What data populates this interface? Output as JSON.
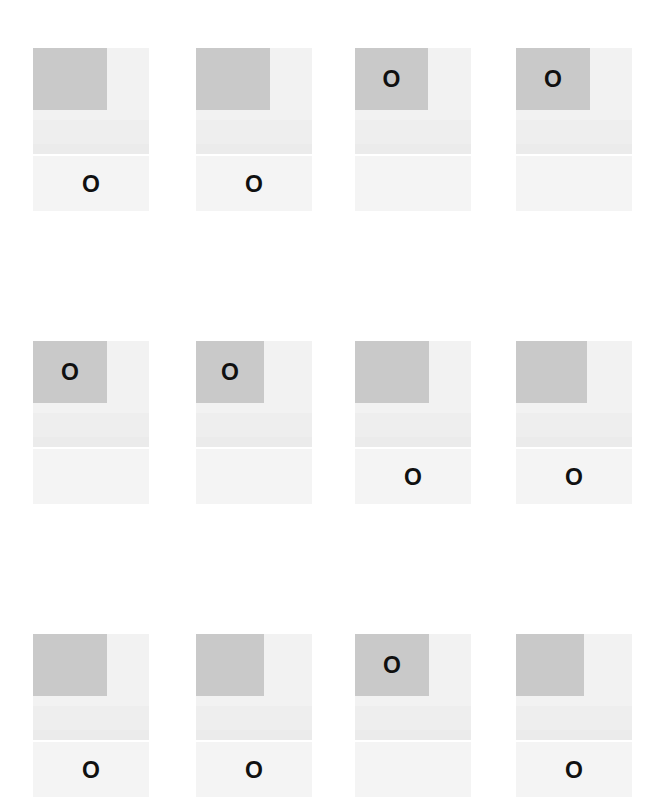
{
  "page": {
    "background_color": "#ffffff",
    "width": 665,
    "height": 797,
    "rows": 3,
    "columns": 4,
    "total_tiles": 12
  },
  "palette": {
    "block_gray": "#c9c9c9",
    "upper_base": "#f2f2f2",
    "mid_band": "#eeeeee",
    "stripe": "#ebebeb",
    "lower_band": "#f4f4f4",
    "marker_color": "#101010",
    "page_background": "#ffffff"
  },
  "marker": {
    "glyph": "O",
    "name": "letter-o-marker"
  },
  "tiles": [
    {
      "id": "tile-r1c1",
      "row": 1,
      "column": 1,
      "x": 33,
      "y": 48,
      "block": {
        "x": 0,
        "y": 0,
        "width": 74,
        "height": 62
      },
      "marker_location": "lower-band",
      "marker": "O"
    },
    {
      "id": "tile-r1c2",
      "row": 1,
      "column": 2,
      "x": 196,
      "y": 48,
      "block": {
        "x": 0,
        "y": 0,
        "width": 74,
        "height": 62
      },
      "marker_location": "lower-band",
      "marker": "O"
    },
    {
      "id": "tile-r1c3",
      "row": 1,
      "column": 3,
      "x": 355,
      "y": 48,
      "block": {
        "x": 0,
        "y": 0,
        "width": 73,
        "height": 62
      },
      "marker_location": "gray-block",
      "marker": "O"
    },
    {
      "id": "tile-r1c4",
      "row": 1,
      "column": 4,
      "x": 516,
      "y": 48,
      "block": {
        "x": 0,
        "y": 0,
        "width": 74,
        "height": 62
      },
      "marker_location": "gray-block",
      "marker": "O"
    },
    {
      "id": "tile-r2c1",
      "row": 2,
      "column": 1,
      "x": 33,
      "y": 341,
      "block": {
        "x": 0,
        "y": 0,
        "width": 74,
        "height": 62
      },
      "marker_location": "gray-block",
      "marker": "O"
    },
    {
      "id": "tile-r2c2",
      "row": 2,
      "column": 2,
      "x": 196,
      "y": 341,
      "block": {
        "x": 0,
        "y": 0,
        "width": 68,
        "height": 62
      },
      "marker_location": "gray-block",
      "marker": "O"
    },
    {
      "id": "tile-r2c3",
      "row": 2,
      "column": 3,
      "x": 355,
      "y": 341,
      "block": {
        "x": 0,
        "y": 0,
        "width": 74,
        "height": 62
      },
      "marker_location": "lower-band",
      "marker": "O"
    },
    {
      "id": "tile-r2c4",
      "row": 2,
      "column": 4,
      "x": 516,
      "y": 341,
      "block": {
        "x": 0,
        "y": 0,
        "width": 71,
        "height": 62
      },
      "marker_location": "lower-band",
      "marker": "O"
    },
    {
      "id": "tile-r3c1",
      "row": 3,
      "column": 1,
      "x": 33,
      "y": 634,
      "block": {
        "x": 0,
        "y": 0,
        "width": 74,
        "height": 62
      },
      "marker_location": "lower-band",
      "marker": "O"
    },
    {
      "id": "tile-r3c2",
      "row": 3,
      "column": 2,
      "x": 196,
      "y": 634,
      "block": {
        "x": 0,
        "y": 0,
        "width": 68,
        "height": 62
      },
      "marker_location": "lower-band",
      "marker": "O"
    },
    {
      "id": "tile-r3c3",
      "row": 3,
      "column": 3,
      "x": 355,
      "y": 634,
      "block": {
        "x": 0,
        "y": 0,
        "width": 74,
        "height": 62
      },
      "marker_location": "gray-block",
      "marker": "O"
    },
    {
      "id": "tile-r3c4",
      "row": 3,
      "column": 4,
      "x": 516,
      "y": 634,
      "block": {
        "x": 0,
        "y": 0,
        "width": 68,
        "height": 62
      },
      "marker_location": "lower-band",
      "marker": "O"
    }
  ]
}
